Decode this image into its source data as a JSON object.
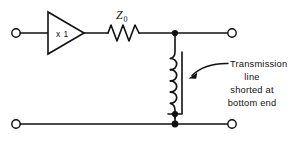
{
  "figure": {
    "kind": "circuit-schematic",
    "background_color": "#ffffff",
    "ink_color": "#111111"
  },
  "amplifier": {
    "gain_label": "x 1",
    "shape": "triangle"
  },
  "resistor": {
    "label_symbol": "Z",
    "label_subscript": "0",
    "style": "zigzag"
  },
  "inductor": {
    "name": "coil",
    "turns": 4
  },
  "annotation": {
    "lines": [
      "Transmission",
      "line",
      "shorted  at",
      "bottom  end"
    ],
    "line_1": "Transmission",
    "line_2": "line",
    "line_3": "shorted  at",
    "line_4": "bottom  end"
  },
  "terminals": {
    "input_top": "open-terminal",
    "input_bottom": "open-terminal",
    "output_top": "open-terminal",
    "output_bottom": "open-terminal"
  }
}
